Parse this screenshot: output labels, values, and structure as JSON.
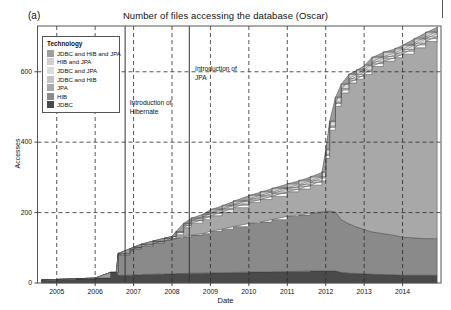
{
  "figure": {
    "panel_label": "(a)",
    "title": "Number of files accessing the database (Oscar)"
  },
  "legend": {
    "title": "Technology",
    "items": [
      {
        "label": "JDBC and HIB and JPA",
        "color": "#9d9d9d"
      },
      {
        "label": "HIB and JPA",
        "color": "#cfcfcf"
      },
      {
        "label": "JDBC and JPA",
        "color": "#dcdcdc"
      },
      {
        "label": "JDBC and HIB",
        "color": "#c4c4c4"
      },
      {
        "label": "JPA",
        "color": "#a8a8a8"
      },
      {
        "label": "HIB",
        "color": "#8a8a8a"
      },
      {
        "label": "JDBC",
        "color": "#4a4a4a"
      }
    ]
  },
  "annotations": [
    {
      "name": "introduction-of-hibernate",
      "lines": [
        "Introduction of",
        "Hibernate"
      ],
      "x_year": 2006.75
    },
    {
      "name": "introduction-of-jpa",
      "lines": [
        "Introduction of",
        "JPA"
      ],
      "x_year": 2008.35
    }
  ],
  "chart_data": {
    "type": "area",
    "title": "Number of files accessing the database (Oscar)",
    "xlabel": "Date",
    "ylabel": "Accesses",
    "xlim": [
      2004.5,
      2015.0
    ],
    "ylim": [
      0,
      730
    ],
    "yticks": [
      0,
      200,
      400,
      600
    ],
    "xticks": [
      2005,
      2006,
      2007,
      2008,
      2009,
      2010,
      2011,
      2012,
      2013,
      2014
    ],
    "grid": "dashed",
    "legend_position": "upper-left",
    "stacked": true,
    "stack_order_bottom_to_top": [
      "JDBC",
      "HIB",
      "JPA",
      "JDBC and HIB",
      "JDBC and JPA",
      "HIB and JPA",
      "JDBC and HIB and JPA"
    ],
    "x": [
      2004.6,
      2005.0,
      2005.5,
      2006.0,
      2006.4,
      2006.55,
      2006.6,
      2006.9,
      2007.0,
      2007.2,
      2007.5,
      2007.8,
      2008.0,
      2008.1,
      2008.3,
      2008.5,
      2008.8,
      2009.0,
      2009.3,
      2009.6,
      2010.0,
      2010.3,
      2010.6,
      2011.0,
      2011.3,
      2011.6,
      2011.9,
      2012.0,
      2012.1,
      2012.25,
      2012.4,
      2012.6,
      2012.8,
      2013.0,
      2013.2,
      2013.5,
      2013.8,
      2014.0,
      2014.3,
      2014.6,
      2014.9
    ],
    "series": [
      {
        "name": "JDBC",
        "values": [
          8,
          10,
          12,
          14,
          30,
          30,
          22,
          22,
          23,
          24,
          25,
          26,
          26,
          27,
          27,
          28,
          28,
          29,
          29,
          30,
          31,
          31,
          32,
          33,
          33,
          34,
          34,
          34,
          34,
          34,
          30,
          28,
          27,
          26,
          25,
          24,
          23,
          22,
          22,
          22,
          22
        ]
      },
      {
        "name": "HIB",
        "values": [
          0,
          0,
          0,
          0,
          0,
          0,
          58,
          70,
          74,
          80,
          88,
          95,
          98,
          100,
          104,
          108,
          112,
          118,
          124,
          130,
          138,
          142,
          148,
          156,
          160,
          164,
          168,
          170,
          170,
          168,
          150,
          140,
          132,
          126,
          120,
          116,
          112,
          108,
          106,
          104,
          104
        ]
      },
      {
        "name": "JPA",
        "values": [
          0,
          0,
          0,
          0,
          0,
          0,
          0,
          0,
          0,
          0,
          0,
          0,
          2,
          10,
          26,
          34,
          40,
          44,
          48,
          54,
          60,
          64,
          66,
          70,
          74,
          80,
          88,
          150,
          230,
          300,
          360,
          400,
          420,
          440,
          470,
          490,
          505,
          520,
          540,
          560,
          575
        ]
      },
      {
        "name": "JDBC and HIB",
        "values": [
          0,
          0,
          0,
          0,
          0,
          0,
          4,
          5,
          5,
          6,
          6,
          6,
          6,
          6,
          6,
          7,
          7,
          7,
          7,
          7,
          7,
          8,
          8,
          8,
          8,
          8,
          8,
          8,
          8,
          8,
          8,
          8,
          8,
          8,
          8,
          8,
          8,
          8,
          8,
          8,
          8
        ]
      },
      {
        "name": "JDBC and JPA",
        "values": [
          0,
          0,
          0,
          0,
          0,
          0,
          0,
          0,
          0,
          0,
          0,
          0,
          0,
          1,
          2,
          2,
          2,
          3,
          3,
          3,
          3,
          4,
          4,
          4,
          4,
          4,
          4,
          4,
          4,
          4,
          4,
          4,
          5,
          5,
          5,
          5,
          5,
          5,
          5,
          5,
          5
        ]
      },
      {
        "name": "HIB and JPA",
        "values": [
          0,
          0,
          0,
          0,
          0,
          0,
          0,
          0,
          0,
          0,
          0,
          0,
          0,
          2,
          4,
          5,
          6,
          7,
          8,
          8,
          9,
          9,
          10,
          10,
          11,
          11,
          12,
          12,
          12,
          12,
          12,
          12,
          12,
          12,
          12,
          12,
          12,
          12,
          12,
          12,
          12
        ]
      },
      {
        "name": "JDBC and HIB and JPA",
        "values": [
          0,
          0,
          0,
          0,
          0,
          0,
          0,
          0,
          0,
          0,
          0,
          0,
          0,
          0,
          1,
          1,
          1,
          2,
          2,
          2,
          2,
          2,
          2,
          2,
          2,
          2,
          2,
          2,
          2,
          2,
          2,
          2,
          2,
          2,
          2,
          2,
          2,
          2,
          2,
          2,
          2
        ]
      }
    ]
  }
}
